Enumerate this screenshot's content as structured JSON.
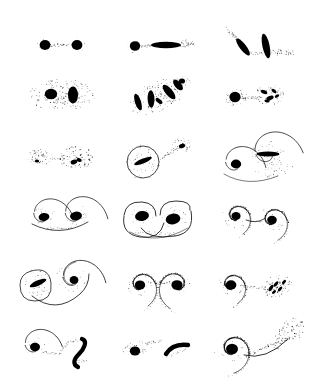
{
  "figure": {
    "background_color": "#ffffff",
    "ink_color": "#000000",
    "width": 322,
    "height": 385,
    "columns": 3,
    "rows": 6,
    "panel_count": 18
  },
  "grid": {
    "col_centers": [
      62,
      160,
      258
    ],
    "row_centers": [
      45,
      95,
      158,
      218,
      285,
      348
    ],
    "panel_width": 98,
    "panel_height": 62
  },
  "panels": [
    {
      "index": 1,
      "name": "round-pair-with-bridge",
      "row": 1,
      "col": 1,
      "cx": 62,
      "cy": 45,
      "label": "Two round nuclei joined by a short dotted bridge",
      "objects": [
        "round-nucleus",
        "round-nucleus",
        "dotted-bridge"
      ]
    },
    {
      "index": 2,
      "name": "round-and-spindle-pair",
      "row": 1,
      "col": 2,
      "cx": 160,
      "cy": 45,
      "label": "Round nucleus linked to an edge-on spindle with faint tails",
      "objects": [
        "round-nucleus",
        "horizontal-spindle",
        "dotted-bridge",
        "dotted-tail"
      ]
    },
    {
      "index": 3,
      "name": "tilted-spindle-pair",
      "row": 1,
      "col": 3,
      "cx": 258,
      "cy": 45,
      "label": "Two tilted spindles with dotted tidal plumes",
      "objects": [
        "tilted-spindle",
        "tilted-spindle",
        "dotted-plume",
        "dotted-plume"
      ]
    },
    {
      "index": 4,
      "name": "pair-in-dust-cloud",
      "row": 2,
      "col": 1,
      "cx": 62,
      "cy": 95,
      "label": "Round nucleus and vertical ellipse inside a broad speckled halo",
      "objects": [
        "round-nucleus",
        "vertical-ellipse",
        "speckle-halo"
      ]
    },
    {
      "index": 5,
      "name": "multi-blob-chain",
      "row": 2,
      "col": 2,
      "cx": 160,
      "cy": 95,
      "label": "Diagonal chain of several dark fragments and spindles",
      "objects": [
        "tilted-spindle",
        "vertical-spindle",
        "fragment-cluster",
        "speckle-halo"
      ]
    },
    {
      "index": 6,
      "name": "nucleus-and-fragments",
      "row": 2,
      "col": 3,
      "cx": 258,
      "cy": 95,
      "label": "Round nucleus with halo joined to a shredded fragment cluster",
      "objects": [
        "round-nucleus",
        "speckle-halo",
        "fragment-cluster",
        "dotted-bridge"
      ]
    },
    {
      "index": 7,
      "name": "diffuse-clump-pair",
      "row": 3,
      "col": 1,
      "cx": 62,
      "cy": 158,
      "label": "Two loose speckled clumps joined by a thin dotted filament",
      "objects": [
        "speckle-clump",
        "speckle-clump",
        "dotted-bridge"
      ]
    },
    {
      "index": 8,
      "name": "ring-galaxy-with-companion",
      "row": 3,
      "col": 2,
      "cx": 160,
      "cy": 158,
      "label": "Ring galaxy with inner tilted bar and a small companion clump",
      "objects": [
        "ring",
        "tilted-spindle",
        "speckle-clump",
        "dotted-bridge"
      ]
    },
    {
      "index": 9,
      "name": "barred-spiral-and-companion",
      "row": 3,
      "col": 3,
      "cx": 258,
      "cy": 158,
      "label": "Large barred disc with sweeping arms beside a small spiral nucleus",
      "objects": [
        "spiral-arm",
        "horizontal-bar",
        "round-nucleus",
        "spiral-arm"
      ]
    },
    {
      "index": 10,
      "name": "twin-spirals-arc",
      "row": 4,
      "col": 1,
      "cx": 62,
      "cy": 218,
      "label": "Two small spirals with dark nuclei linked by a long sweeping arc",
      "objects": [
        "spiral",
        "spiral",
        "sweeping-arc",
        "dotted-tail"
      ]
    },
    {
      "index": 11,
      "name": "interlocking-spiral-pair",
      "row": 4,
      "col": 2,
      "cx": 160,
      "cy": 218,
      "label": "Interlocking S-shaped spiral pair with heavy nuclei",
      "objects": [
        "spiral",
        "spiral",
        "sweeping-arc"
      ]
    },
    {
      "index": 12,
      "name": "spiral-pair-with-bridge",
      "row": 4,
      "col": 3,
      "cx": 258,
      "cy": 218,
      "label": "Two multi-armed spirals joined by a short straight bridge",
      "objects": [
        "spiral",
        "spiral",
        "straight-bridge"
      ]
    },
    {
      "index": 13,
      "name": "ring-and-spiral-arc",
      "row": 5,
      "col": 1,
      "cx": 62,
      "cy": 285,
      "label": "Oval ring with inner bar beside a spiral, joined by a long outer arc",
      "objects": [
        "ring",
        "tilted-spindle",
        "spiral",
        "sweeping-arc"
      ]
    },
    {
      "index": 14,
      "name": "mirror-spiral-pair",
      "row": 5,
      "col": 2,
      "cx": 160,
      "cy": 285,
      "label": "Mirror-image spiral pair connected by a dotted bridge",
      "objects": [
        "spiral",
        "spiral",
        "dotted-bridge"
      ]
    },
    {
      "index": 15,
      "name": "spiral-with-shredded-companion",
      "row": 5,
      "col": 3,
      "cx": 258,
      "cy": 285,
      "label": "Spiral with long dotted bridge to a shredded debris cluster",
      "objects": [
        "spiral",
        "dotted-bridge",
        "fragment-cluster"
      ]
    },
    {
      "index": 16,
      "name": "spiral-and-curved-streak",
      "row": 6,
      "col": 1,
      "cx": 62,
      "cy": 348,
      "label": "Small spiral with a dotted loop ending in a curved dark streak",
      "objects": [
        "spiral",
        "dotted-loop",
        "curved-streak"
      ]
    },
    {
      "index": 17,
      "name": "nucleus-and-comma-streak",
      "row": 6,
      "col": 2,
      "cx": 160,
      "cy": 348,
      "label": "Round nucleus with dotted plume beside a comma-shaped dark streak",
      "objects": [
        "round-nucleus",
        "dotted-plume",
        "curved-streak"
      ]
    },
    {
      "index": 18,
      "name": "spiral-with-long-tail",
      "row": 6,
      "col": 3,
      "cx": 258,
      "cy": 348,
      "label": "Tightly wound spiral trailing a long dashed tail into a speckled plume",
      "objects": [
        "spiral",
        "dashed-tail",
        "speckle-plume"
      ]
    }
  ]
}
